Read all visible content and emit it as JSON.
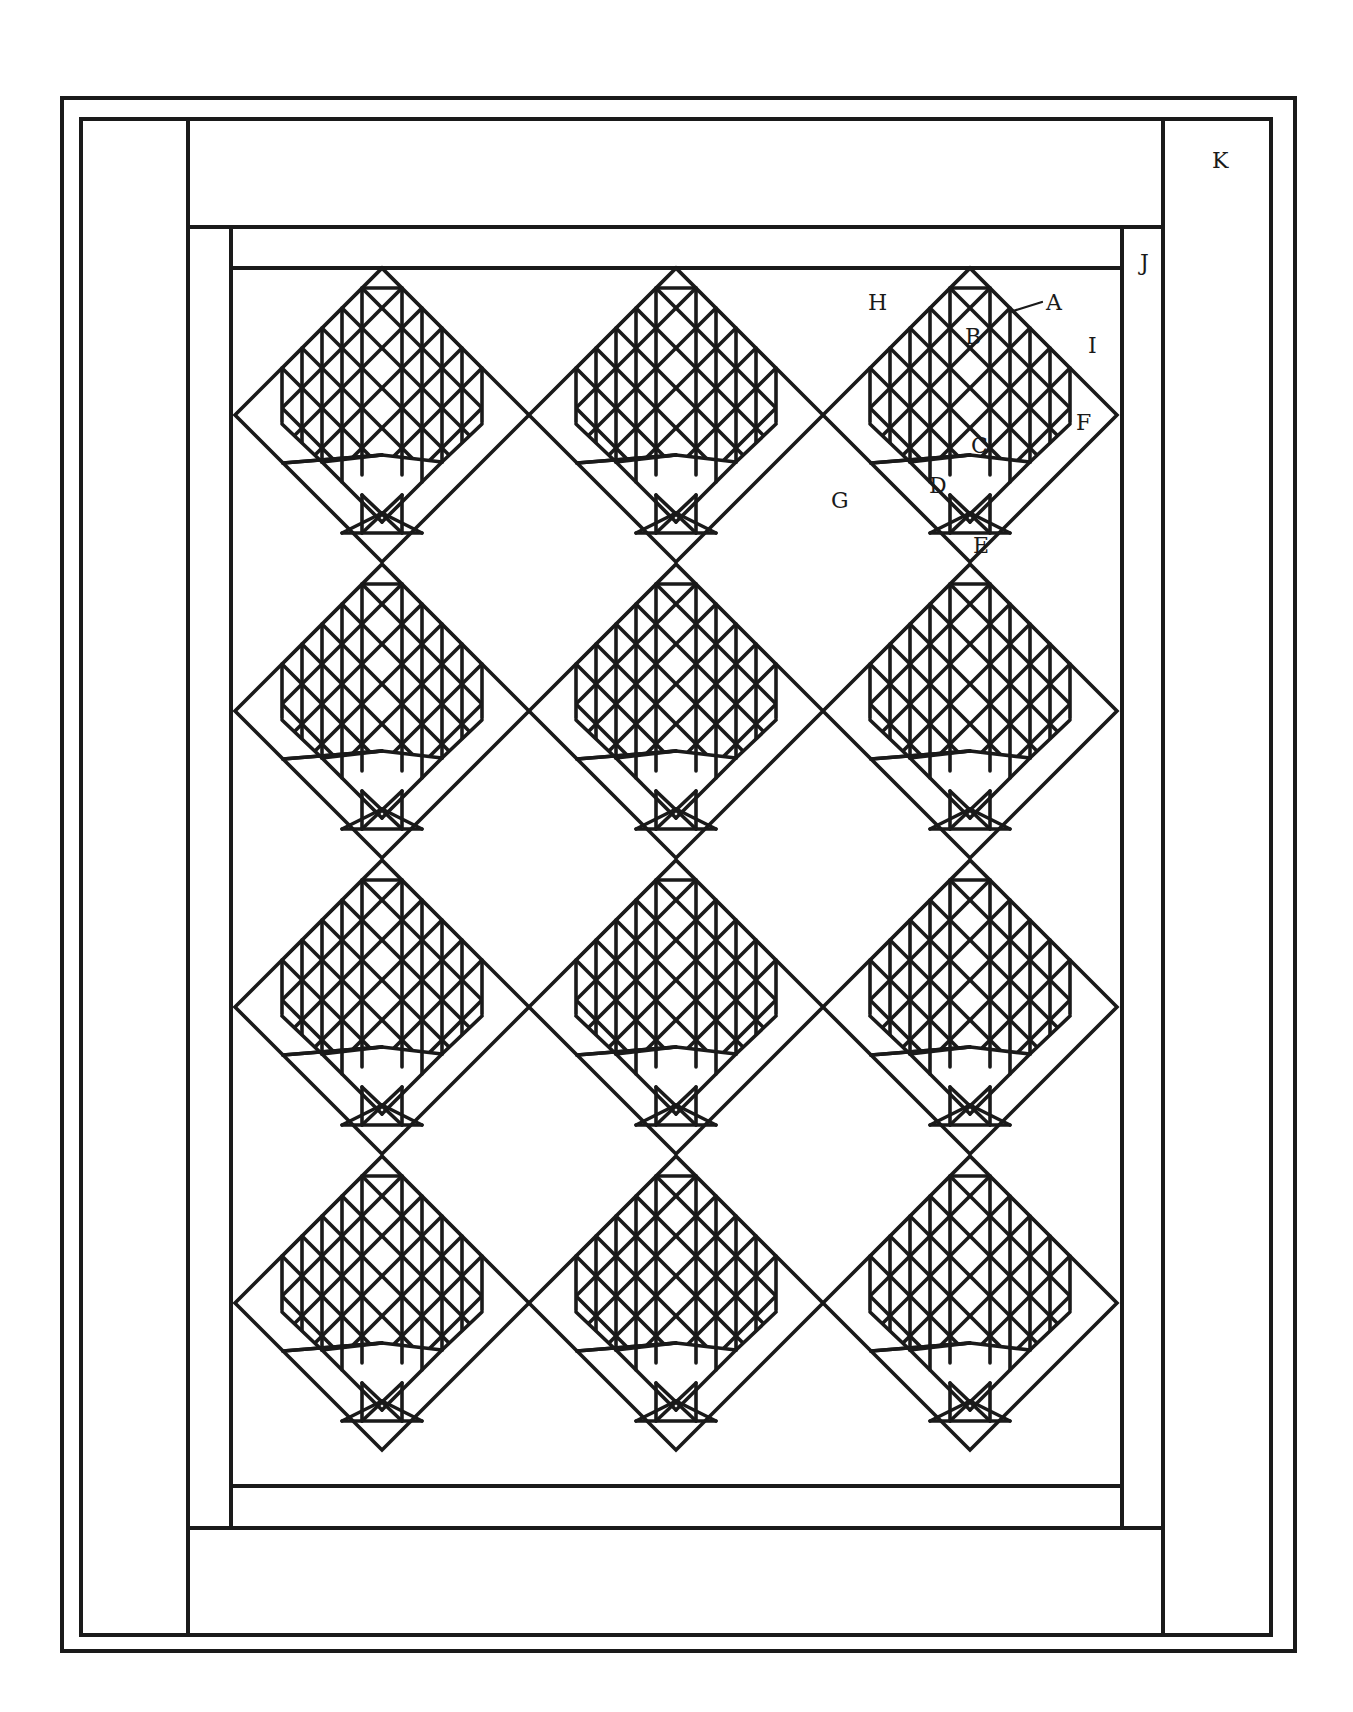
{
  "diagram": {
    "type": "quilt-layout",
    "pattern": "pine-tree",
    "setting": "on-point",
    "grid": {
      "columns": 3,
      "rows": 4,
      "block_count": 12
    },
    "line_color": "#1a1a1a",
    "background": "#ffffff"
  },
  "labels": {
    "A": "A",
    "B": "B",
    "C": "C",
    "D": "D",
    "E": "E",
    "F": "F",
    "G": "G",
    "H": "H",
    "I": "I",
    "J": "J",
    "K": "K"
  },
  "geometry": {
    "outer_frame": {
      "x": 62,
      "y": 98,
      "w": 1233,
      "h": 1553
    },
    "inner_frame": {
      "x": 81,
      "y": 119,
      "w": 1190,
      "h": 1516
    },
    "top_border": {
      "x1": 188,
      "y1": 119,
      "x2": 1163,
      "y2": 227
    },
    "bottom_border": {
      "x1": 188,
      "y1": 1528,
      "x2": 1163,
      "y2": 1635
    },
    "left_border_x": 188,
    "right_border_x": 1163,
    "left_strip_x": 231,
    "right_strip_x": 1122,
    "field": {
      "x1": 231,
      "y1": 268,
      "x2": 1122,
      "y2": 1486
    },
    "block_half_diagonal": 147,
    "column_centers": [
      382,
      676,
      970
    ],
    "row_centers": [
      415,
      711,
      1007,
      1303
    ]
  }
}
